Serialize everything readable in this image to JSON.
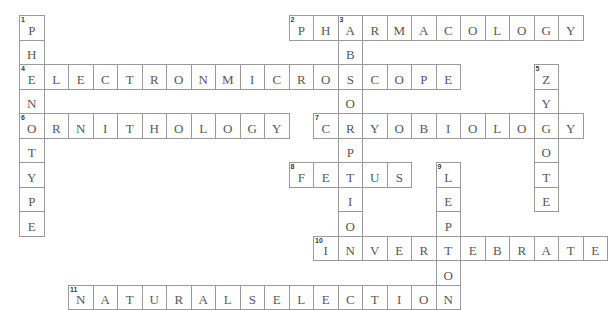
{
  "puzzle": {
    "title": "Biology Crossword Grid",
    "grid": {
      "origin_x": 19,
      "origin_y": 15,
      "cell_size": 24.5,
      "columns": 24,
      "rows": 12,
      "border_color": "#9a9a9a",
      "letter_color": "#585858",
      "number_color": "#3a3a3a",
      "background": "#ffffff"
    },
    "entries": [
      {
        "number": "1",
        "direction": "down",
        "answer": "PHENOTYPE",
        "row": 0,
        "col": 0
      },
      {
        "number": "2",
        "direction": "across",
        "answer": "PHARMACOLOGY",
        "row": 0,
        "col": 11
      },
      {
        "number": "3",
        "direction": "down",
        "answer": "ABSORPTION",
        "row": 0,
        "col": 13
      },
      {
        "number": "4",
        "direction": "across",
        "answer": "ELECTRONMICROSCOPE",
        "row": 2,
        "col": 0
      },
      {
        "number": "5",
        "direction": "down",
        "answer": "ZYGOTE",
        "row": 2,
        "col": 21
      },
      {
        "number": "6",
        "direction": "across",
        "answer": "ORNITHOLOGY",
        "row": 4,
        "col": 0
      },
      {
        "number": "7",
        "direction": "across",
        "answer": "CRYOBIOLOGY",
        "row": 4,
        "col": 12
      },
      {
        "number": "8",
        "direction": "across",
        "answer": "FETUS",
        "row": 6,
        "col": 11
      },
      {
        "number": "9",
        "direction": "down",
        "answer": "LEPTON",
        "row": 6,
        "col": 17
      },
      {
        "number": "10",
        "direction": "across",
        "answer": "INVERTEBRATE",
        "row": 9,
        "col": 12
      },
      {
        "number": "11",
        "direction": "across",
        "answer": "NATURALSELECTION",
        "row": 11,
        "col": 2
      }
    ]
  }
}
